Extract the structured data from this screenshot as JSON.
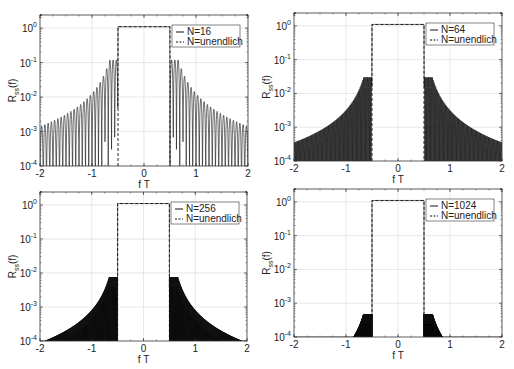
{
  "chart_data": [
    {
      "type": "line",
      "panel": "top-left",
      "box": {
        "x0": 40,
        "x1": 248,
        "y0": 15,
        "y1": 166
      },
      "xlabel": "f T",
      "ylabel": "R_ss(f)",
      "xlim": [
        -2,
        2
      ],
      "ylim_log10": [
        -4,
        0.38
      ],
      "yscale": "log",
      "xticks": [
        "-2",
        "-1",
        "0",
        "1",
        "2"
      ],
      "yticks": [
        "10^0",
        "10^-1",
        "10^-2",
        "10^-3",
        "10^-4"
      ],
      "grid": true,
      "legend": {
        "position": "upper right",
        "entries": [
          "N=16",
          "N=unendlich"
        ]
      },
      "series": [
        {
          "name": "N=16",
          "style": "solid",
          "N": 16,
          "passband": [
            -0.5,
            0.5
          ],
          "passband_value": 1.1
        },
        {
          "name": "N=unendlich",
          "style": "dashed",
          "passband": [
            -0.5,
            0.5
          ],
          "passband_value": 1.0
        }
      ]
    },
    {
      "type": "line",
      "panel": "top-right",
      "box": {
        "x0": 294,
        "x1": 502,
        "y0": 13,
        "y1": 161
      },
      "xlabel": "f T",
      "ylabel": "R_ss(f)",
      "xlim": [
        -2,
        2
      ],
      "ylim_log10": [
        -4,
        0.38
      ],
      "yscale": "log",
      "xticks": [
        "-2",
        "-1",
        "0",
        "1",
        "2"
      ],
      "yticks": [
        "10^0",
        "10^-1",
        "10^-2",
        "10^-3",
        "10^-4"
      ],
      "grid": true,
      "legend": {
        "position": "upper right",
        "entries": [
          "N=64",
          "N=unendlich"
        ]
      },
      "series": [
        {
          "name": "N=64",
          "style": "solid",
          "N": 64,
          "passband": [
            -0.5,
            0.5
          ],
          "passband_value": 1.1
        },
        {
          "name": "N=unendlich",
          "style": "dashed",
          "passband": [
            -0.5,
            0.5
          ],
          "passband_value": 1.0
        }
      ]
    },
    {
      "type": "line",
      "panel": "bottom-left",
      "box": {
        "x0": 40,
        "x1": 247,
        "y0": 192,
        "y1": 341
      },
      "xlabel": "f T",
      "ylabel": "R_ss(f)",
      "xlim": [
        -2,
        2
      ],
      "ylim_log10": [
        -4,
        0.38
      ],
      "yscale": "log",
      "xticks": [
        "-2",
        "-1",
        "0",
        "1",
        "2"
      ],
      "yticks": [
        "10^0",
        "10^-1",
        "10^-2",
        "10^-3",
        "10^-4"
      ],
      "grid": true,
      "legend": {
        "position": "upper right",
        "entries": [
          "N=256",
          "N=unendlich"
        ]
      },
      "series": [
        {
          "name": "N=256",
          "style": "solid",
          "N": 256,
          "passband": [
            -0.5,
            0.5
          ],
          "passband_value": 1.1
        },
        {
          "name": "N=unendlich",
          "style": "dashed",
          "passband": [
            -0.5,
            0.5
          ],
          "passband_value": 1.0
        }
      ]
    },
    {
      "type": "line",
      "panel": "bottom-right",
      "box": {
        "x0": 294,
        "x1": 502,
        "y0": 189,
        "y1": 337
      },
      "xlabel": "f T",
      "ylabel": "R_ss(f)",
      "xlim": [
        -2,
        2
      ],
      "ylim_log10": [
        -4,
        0.38
      ],
      "yscale": "log",
      "xticks": [
        "-2",
        "-1",
        "0",
        "1",
        "2"
      ],
      "yticks": [
        "10^0",
        "10^-1",
        "10^-2",
        "10^-3",
        "10^-4"
      ],
      "grid": true,
      "legend": {
        "position": "upper right",
        "entries": [
          "N=1024",
          "N=unendlich"
        ]
      },
      "series": [
        {
          "name": "N=1024",
          "style": "solid",
          "N": 1024,
          "passband": [
            -0.5,
            0.5
          ],
          "passband_value": 1.1
        },
        {
          "name": "N=unendlich",
          "style": "dashed",
          "passband": [
            -0.5,
            0.5
          ],
          "passband_value": 1.0
        }
      ]
    }
  ],
  "colors": {
    "line": "#111111",
    "axis": "#333333",
    "grid": "#d8d8d8",
    "background": "#ffffff"
  }
}
